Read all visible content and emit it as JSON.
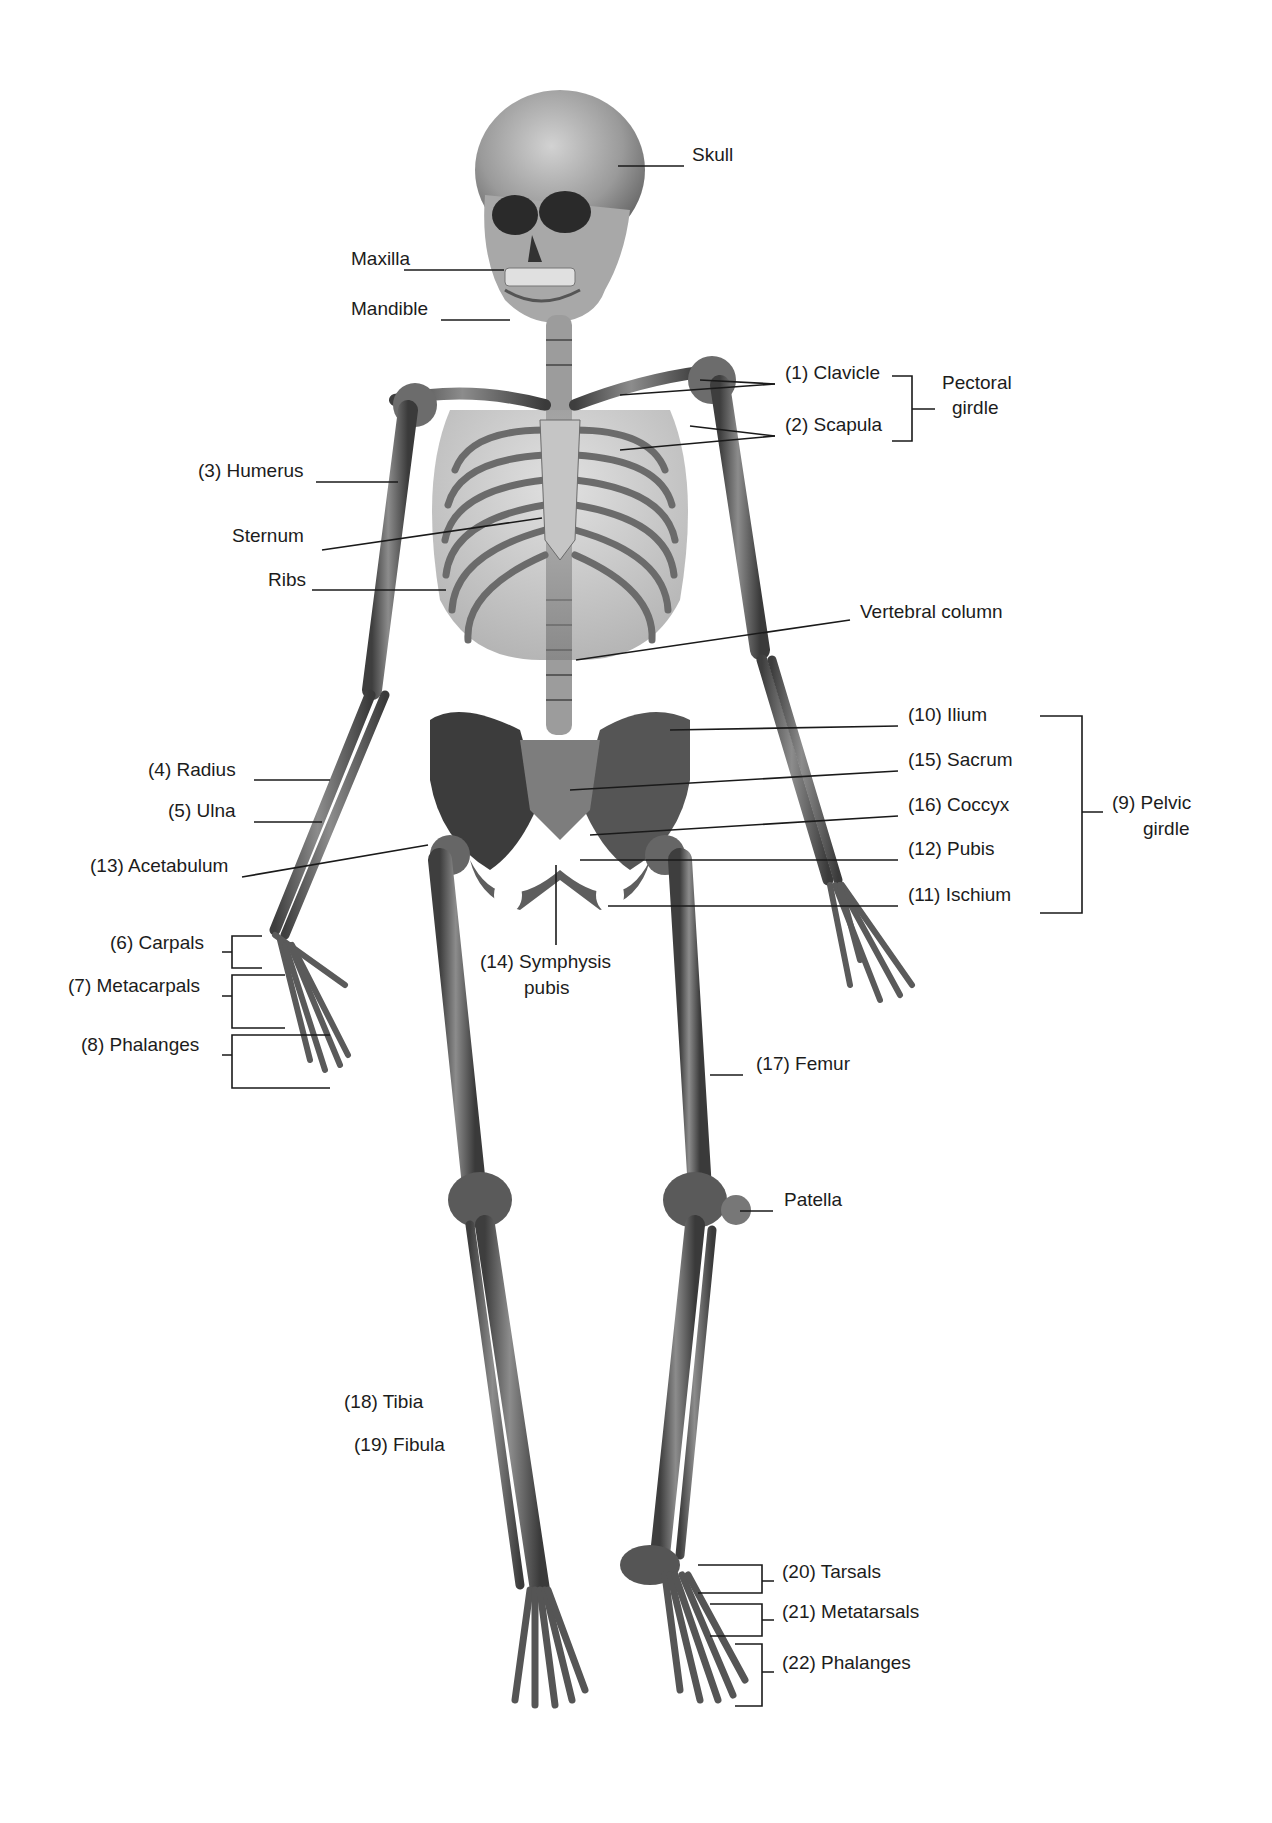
{
  "diagram": {
    "colors": {
      "background": "#ffffff",
      "bone_dark": "#4a4a4a",
      "bone_mid": "#7a7a7a",
      "bone_light": "#b5b5b5",
      "line": "#1a1a1a",
      "text": "#1c1c1c"
    }
  },
  "labels": [
    {
      "id": "skull",
      "text": "Skull",
      "x": 692,
      "y": 155,
      "align": "l"
    },
    {
      "id": "maxilla",
      "text": "Maxilla",
      "x": 351,
      "y": 259,
      "align": "l"
    },
    {
      "id": "mandible",
      "text": "Mandible",
      "x": 351,
      "y": 309,
      "align": "l"
    },
    {
      "id": "clavicle",
      "text": "(1) Clavicle",
      "x": 785,
      "y": 373,
      "align": "l"
    },
    {
      "id": "scapula",
      "text": "(2) Scapula",
      "x": 785,
      "y": 425,
      "align": "l"
    },
    {
      "id": "pectoral-girdle-1",
      "text": "Pectoral",
      "x": 942,
      "y": 383,
      "align": "l"
    },
    {
      "id": "pectoral-girdle-2",
      "text": "girdle",
      "x": 952,
      "y": 408,
      "align": "l"
    },
    {
      "id": "humerus",
      "text": "(3) Humerus",
      "x": 198,
      "y": 471,
      "align": "l"
    },
    {
      "id": "sternum",
      "text": "Sternum",
      "x": 232,
      "y": 536,
      "align": "l"
    },
    {
      "id": "ribs",
      "text": "Ribs",
      "x": 268,
      "y": 580,
      "align": "l"
    },
    {
      "id": "vertebral-column",
      "text": "Vertebral column",
      "x": 860,
      "y": 612,
      "align": "l"
    },
    {
      "id": "ilium",
      "text": "(10) Ilium",
      "x": 908,
      "y": 715,
      "align": "l"
    },
    {
      "id": "sacrum",
      "text": "(15) Sacrum",
      "x": 908,
      "y": 760,
      "align": "l"
    },
    {
      "id": "coccyx",
      "text": "(16) Coccyx",
      "x": 908,
      "y": 805,
      "align": "l"
    },
    {
      "id": "pubis",
      "text": "(12) Pubis",
      "x": 908,
      "y": 849,
      "align": "l"
    },
    {
      "id": "ischium",
      "text": "(11) Ischium",
      "x": 908,
      "y": 895,
      "align": "l"
    },
    {
      "id": "pelvic-girdle-1",
      "text": "(9) Pelvic",
      "x": 1112,
      "y": 803,
      "align": "l"
    },
    {
      "id": "pelvic-girdle-2",
      "text": "girdle",
      "x": 1143,
      "y": 829,
      "align": "l"
    },
    {
      "id": "radius",
      "text": "(4) Radius",
      "x": 148,
      "y": 770,
      "align": "l"
    },
    {
      "id": "ulna",
      "text": "(5) Ulna",
      "x": 168,
      "y": 811,
      "align": "l"
    },
    {
      "id": "acetabulum",
      "text": "(13) Acetabulum",
      "x": 90,
      "y": 866,
      "align": "l"
    },
    {
      "id": "carpals",
      "text": "(6) Carpals",
      "x": 110,
      "y": 943,
      "align": "l"
    },
    {
      "id": "metacarpals",
      "text": "(7) Metacarpals",
      "x": 68,
      "y": 986,
      "align": "l"
    },
    {
      "id": "phalanges-hand",
      "text": "(8) Phalanges",
      "x": 81,
      "y": 1045,
      "align": "l"
    },
    {
      "id": "symphysis-1",
      "text": "(14) Symphysis",
      "x": 480,
      "y": 962,
      "align": "l"
    },
    {
      "id": "symphysis-2",
      "text": "pubis",
      "x": 524,
      "y": 988,
      "align": "l"
    },
    {
      "id": "femur",
      "text": "(17) Femur",
      "x": 756,
      "y": 1064,
      "align": "l"
    },
    {
      "id": "patella",
      "text": "Patella",
      "x": 784,
      "y": 1200,
      "align": "l"
    },
    {
      "id": "tibia",
      "text": "(18) Tibia",
      "x": 344,
      "y": 1402,
      "align": "l"
    },
    {
      "id": "fibula",
      "text": "(19) Fibula",
      "x": 354,
      "y": 1445,
      "align": "l"
    },
    {
      "id": "tarsals",
      "text": "(20) Tarsals",
      "x": 782,
      "y": 1572,
      "align": "l"
    },
    {
      "id": "metatarsals",
      "text": "(21) Metatarsals",
      "x": 782,
      "y": 1612,
      "align": "l"
    },
    {
      "id": "phalanges-foot",
      "text": "(22) Phalanges",
      "x": 782,
      "y": 1663,
      "align": "l"
    }
  ],
  "leader_lines": [
    [
      618,
      166,
      684,
      166
    ],
    [
      404,
      270,
      504,
      270
    ],
    [
      441,
      320,
      510,
      320
    ],
    [
      775,
      384,
      700,
      380
    ],
    [
      775,
      384,
      620,
      395
    ],
    [
      775,
      436,
      690,
      426
    ],
    [
      775,
      436,
      620,
      450
    ],
    [
      316,
      482,
      398,
      482
    ],
    [
      322,
      550,
      542,
      518
    ],
    [
      312,
      590,
      446,
      590
    ],
    [
      850,
      620,
      576,
      660
    ],
    [
      898,
      726,
      670,
      730
    ],
    [
      898,
      771,
      570,
      790
    ],
    [
      898,
      816,
      590,
      835
    ],
    [
      898,
      860,
      580,
      860
    ],
    [
      898,
      906,
      608,
      906
    ],
    [
      254,
      780,
      330,
      780
    ],
    [
      254,
      822,
      322,
      822
    ],
    [
      242,
      877,
      428,
      845
    ],
    [
      556,
      865,
      556,
      945
    ],
    [
      743,
      1075,
      710,
      1075
    ],
    [
      773,
      1211,
      740,
      1211
    ]
  ],
  "brackets": [
    {
      "id": "pectoral",
      "x": 912,
      "y1": 376,
      "y2": 441,
      "tick_in": 892,
      "tick_out": 935,
      "mid": 409
    },
    {
      "id": "pelvic",
      "x": 1082,
      "y1": 716,
      "y2": 913,
      "tick_in": 1040,
      "tick_out": 1103,
      "mid": 812
    },
    {
      "id": "carpals",
      "x": 232,
      "y1": 936,
      "y2": 968,
      "tick_in": 262,
      "tick_out": 222,
      "mid": 952
    },
    {
      "id": "metacarpals",
      "x": 232,
      "y1": 975,
      "y2": 1028,
      "tick_in": 285,
      "tick_out": 222,
      "mid": 996
    },
    {
      "id": "phalanges-hand",
      "x": 232,
      "y1": 1035,
      "y2": 1088,
      "tick_in": 330,
      "tick_out": 222,
      "mid": 1055
    },
    {
      "id": "tarsals",
      "x": 762,
      "y1": 1565,
      "y2": 1593,
      "tick_in": 698,
      "tick_out": 774,
      "mid": 1581
    },
    {
      "id": "metatarsals",
      "x": 762,
      "y1": 1604,
      "y2": 1636,
      "tick_in": 710,
      "tick_out": 774,
      "mid": 1620
    },
    {
      "id": "phalanges-foot",
      "x": 762,
      "y1": 1644,
      "y2": 1706,
      "tick_in": 735,
      "tick_out": 774,
      "mid": 1672
    }
  ]
}
